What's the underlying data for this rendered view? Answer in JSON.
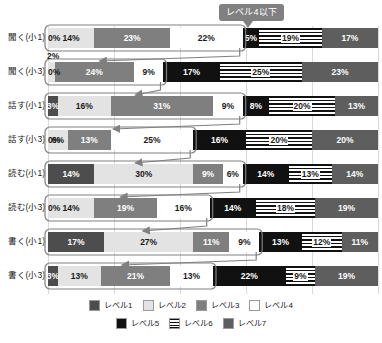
{
  "callout": {
    "label": "レベル4以下",
    "icon": "down-arrow-pointer"
  },
  "legend": {
    "rows": [
      [
        {
          "label": "レベル1",
          "level": 1,
          "color": "#4d4d4d"
        },
        {
          "label": "レベル2",
          "level": 2,
          "color": "#e3e3e3"
        },
        {
          "label": "レベル3",
          "level": 3,
          "color": "#7f7f7f"
        },
        {
          "label": "レベル4",
          "level": 4,
          "color": "#ffffff"
        }
      ],
      [
        {
          "label": "レベル5",
          "level": 5,
          "color": "#111111"
        },
        {
          "label": "レベル6",
          "level": 6,
          "color": "#111111"
        },
        {
          "label": "レベル7",
          "level": 7,
          "color": "#5e5e5e"
        }
      ]
    ]
  },
  "chart_data": {
    "type": "bar",
    "orientation": "horizontal",
    "stacked": true,
    "stack_total": 100,
    "title": "",
    "xlabel": "",
    "ylabel": "",
    "xlim": [
      0,
      100
    ],
    "grid": true,
    "legend_position": "bottom",
    "annotations": [
      {
        "text": "レベル4以下",
        "type": "callout",
        "points_to": "levels 1-4 cumulative region of each bar"
      }
    ],
    "categories": [
      "聞く(小1)",
      "聞く(小3)",
      "話す(小1)",
      "話す(小3)",
      "読む(小1)",
      "読む(小3)",
      "書く(小1)",
      "書く(小3)"
    ],
    "series": [
      {
        "name": "レベル1",
        "values": [
          0,
          0,
          3,
          0,
          14,
          0,
          17,
          3
        ]
      },
      {
        "name": "レベル2",
        "values": [
          14,
          2,
          16,
          6,
          30,
          14,
          27,
          13
        ]
      },
      {
        "name": "レベル3",
        "values": [
          23,
          24,
          31,
          13,
          9,
          19,
          11,
          21
        ]
      },
      {
        "name": "レベル4",
        "values": [
          22,
          9,
          9,
          25,
          6,
          16,
          9,
          13
        ]
      },
      {
        "name": "レベル5",
        "values": [
          5,
          17,
          8,
          16,
          14,
          14,
          13,
          22
        ]
      },
      {
        "name": "レベル6",
        "values": [
          19,
          25,
          20,
          20,
          13,
          18,
          12,
          9
        ]
      },
      {
        "name": "レベル7",
        "values": [
          17,
          23,
          13,
          20,
          14,
          19,
          11,
          19
        ]
      }
    ],
    "rows": [
      {
        "label": "聞く(小1)",
        "segments": [
          {
            "level": 1,
            "value": 0,
            "text": "0%",
            "label_outside": false
          },
          {
            "level": 2,
            "value": 14,
            "text": "14%",
            "label_outside": false
          },
          {
            "level": 3,
            "value": 23,
            "text": "23%",
            "label_outside": false
          },
          {
            "level": 4,
            "value": 22,
            "text": "22%",
            "label_outside": false
          },
          {
            "level": 5,
            "value": 5,
            "text": "5%",
            "label_outside": false
          },
          {
            "level": 6,
            "value": 19,
            "text": "19%",
            "label_outside": false
          },
          {
            "level": 7,
            "value": 17,
            "text": "17%",
            "label_outside": false
          }
        ]
      },
      {
        "label": "聞く(小3)",
        "segments": [
          {
            "level": 1,
            "value": 0,
            "text": "0%",
            "label_outside": false
          },
          {
            "level": 2,
            "value": 2,
            "text": "2%",
            "label_outside": true
          },
          {
            "level": 3,
            "value": 24,
            "text": "24%",
            "label_outside": false
          },
          {
            "level": 4,
            "value": 9,
            "text": "9%",
            "label_outside": false
          },
          {
            "level": 5,
            "value": 17,
            "text": "17%",
            "label_outside": false
          },
          {
            "level": 6,
            "value": 25,
            "text": "25%",
            "label_outside": false
          },
          {
            "level": 7,
            "value": 23,
            "text": "23%",
            "label_outside": false
          }
        ]
      },
      {
        "label": "話す(小1)",
        "segments": [
          {
            "level": 1,
            "value": 3,
            "text": "3%",
            "label_outside": false
          },
          {
            "level": 2,
            "value": 16,
            "text": "16%",
            "label_outside": false
          },
          {
            "level": 3,
            "value": 31,
            "text": "31%",
            "label_outside": false
          },
          {
            "level": 4,
            "value": 9,
            "text": "9%",
            "label_outside": false
          },
          {
            "level": 5,
            "value": 8,
            "text": "8%",
            "label_outside": false
          },
          {
            "level": 6,
            "value": 20,
            "text": "20%",
            "label_outside": false
          },
          {
            "level": 7,
            "value": 13,
            "text": "13%",
            "label_outside": false
          }
        ]
      },
      {
        "label": "話す(小3)",
        "segments": [
          {
            "level": 1,
            "value": 0,
            "text": "0%",
            "label_outside": false
          },
          {
            "level": 2,
            "value": 6,
            "text": "6%",
            "label_outside": false
          },
          {
            "level": 3,
            "value": 13,
            "text": "13%",
            "label_outside": false
          },
          {
            "level": 4,
            "value": 25,
            "text": "25%",
            "label_outside": false
          },
          {
            "level": 5,
            "value": 16,
            "text": "16%",
            "label_outside": false
          },
          {
            "level": 6,
            "value": 20,
            "text": "20%",
            "label_outside": false
          },
          {
            "level": 7,
            "value": 20,
            "text": "20%",
            "label_outside": false
          }
        ]
      },
      {
        "label": "読む(小1)",
        "segments": [
          {
            "level": 1,
            "value": 14,
            "text": "14%",
            "label_outside": false
          },
          {
            "level": 2,
            "value": 30,
            "text": "30%",
            "label_outside": false
          },
          {
            "level": 3,
            "value": 9,
            "text": "9%",
            "label_outside": false
          },
          {
            "level": 4,
            "value": 6,
            "text": "6%",
            "label_outside": false
          },
          {
            "level": 5,
            "value": 14,
            "text": "14%",
            "label_outside": false
          },
          {
            "level": 6,
            "value": 13,
            "text": "13%",
            "label_outside": false
          },
          {
            "level": 7,
            "value": 14,
            "text": "14%",
            "label_outside": false
          }
        ]
      },
      {
        "label": "読む(小3)",
        "segments": [
          {
            "level": 1,
            "value": 0,
            "text": "0%",
            "label_outside": false
          },
          {
            "level": 2,
            "value": 14,
            "text": "14%",
            "label_outside": false
          },
          {
            "level": 3,
            "value": 19,
            "text": "19%",
            "label_outside": false
          },
          {
            "level": 4,
            "value": 16,
            "text": "16%",
            "label_outside": false
          },
          {
            "level": 5,
            "value": 14,
            "text": "14%",
            "label_outside": false
          },
          {
            "level": 6,
            "value": 18,
            "text": "18%",
            "label_outside": false
          },
          {
            "level": 7,
            "value": 19,
            "text": "19%",
            "label_outside": false
          }
        ]
      },
      {
        "label": "書く(小1)",
        "segments": [
          {
            "level": 1,
            "value": 17,
            "text": "17%",
            "label_outside": false
          },
          {
            "level": 2,
            "value": 27,
            "text": "27%",
            "label_outside": false
          },
          {
            "level": 3,
            "value": 11,
            "text": "11%",
            "label_outside": false
          },
          {
            "level": 4,
            "value": 9,
            "text": "9%",
            "label_outside": false
          },
          {
            "level": 5,
            "value": 13,
            "text": "13%",
            "label_outside": false
          },
          {
            "level": 6,
            "value": 12,
            "text": "12%",
            "label_outside": false
          },
          {
            "level": 7,
            "value": 11,
            "text": "11%",
            "label_outside": false
          }
        ]
      },
      {
        "label": "書く(小3)",
        "segments": [
          {
            "level": 1,
            "value": 3,
            "text": "3%",
            "label_outside": false
          },
          {
            "level": 2,
            "value": 13,
            "text": "13%",
            "label_outside": false
          },
          {
            "level": 3,
            "value": 21,
            "text": "21%",
            "label_outside": false
          },
          {
            "level": 4,
            "value": 13,
            "text": "13%",
            "label_outside": false
          },
          {
            "level": 5,
            "value": 22,
            "text": "22%",
            "label_outside": false
          },
          {
            "level": 6,
            "value": 9,
            "text": "9%",
            "label_outside": false
          },
          {
            "level": 7,
            "value": 19,
            "text": "19%",
            "label_outside": false
          }
        ]
      }
    ]
  }
}
